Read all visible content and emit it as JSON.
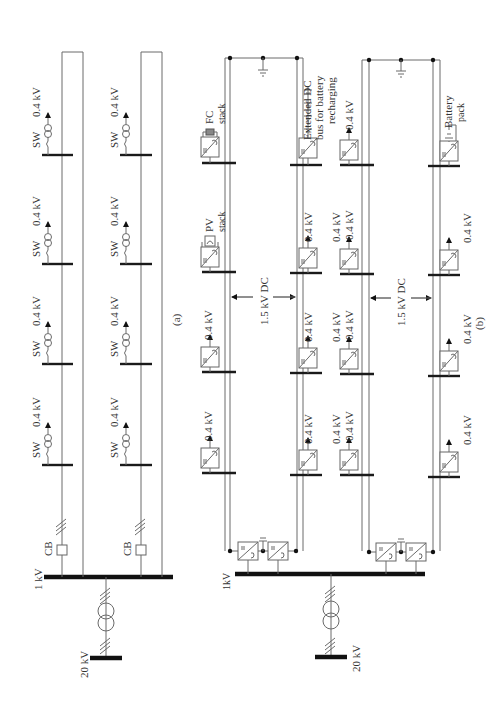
{
  "figure": {
    "panel_a": {
      "label": "(a)",
      "hv_bus": "20 kV",
      "lv_bus": "1 kV",
      "breaker": "CB",
      "feeders": [
        {
          "loads": [
            {
              "switch": "SW",
              "voltage": "0.4 kV"
            },
            {
              "switch": "SW",
              "voltage": "0.4 kV"
            },
            {
              "switch": "SW",
              "voltage": "0.4 kV"
            },
            {
              "switch": "SW",
              "voltage": "0.4 kV"
            }
          ]
        },
        {
          "loads": [
            {
              "switch": "SW",
              "voltage": "0.4 kV"
            },
            {
              "switch": "SW",
              "voltage": "0.4 kV"
            },
            {
              "switch": "SW",
              "voltage": "0.4 kV"
            },
            {
              "switch": "SW",
              "voltage": "0.4 kV"
            }
          ]
        }
      ]
    },
    "panel_b": {
      "label": "(b)",
      "hv_bus": "20 kV",
      "lv_bus": "1kV",
      "dc_link": "1.5 kV DC",
      "fc": {
        "line1": "FC",
        "line2": "stack"
      },
      "pv": {
        "line1": "PV",
        "line2": "stack"
      },
      "extended_bus": {
        "line1": "Extended DC",
        "line2": "bus for battery",
        "line3": "recharging"
      },
      "battery": {
        "line1": "Battery",
        "line2": "pack"
      },
      "load_voltage": "0.4 kV"
    }
  }
}
